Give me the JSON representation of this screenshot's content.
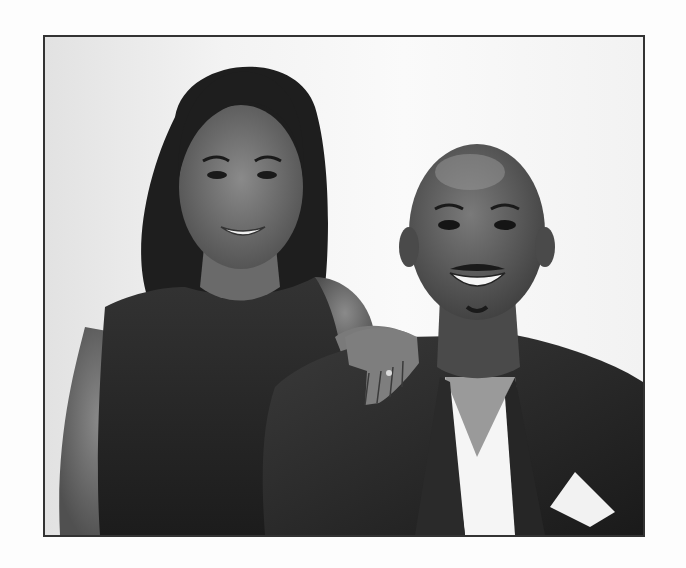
{
  "image": {
    "alt": "Black and white portrait of a smiling woman with long straight hair in a sleeveless dark dress, resting her hand on the shoulder of a smiling bald man in a dark blazer with white shirt and pocket square",
    "style": "grayscale photograph with thin dark border",
    "colors": {
      "background": "#fdfdfd",
      "border": "#333333",
      "backdrop": "#f0f0f0",
      "dark_clothing": "#2a2a2a",
      "skin": "#6e6e6e",
      "hair": "#1e1e1e",
      "white_shirt": "#f5f5f5"
    },
    "subjects": [
      {
        "label": "woman",
        "position": "left",
        "description": "long dark straight hair, sleeveless dark dress, hand on man's shoulder"
      },
      {
        "label": "man",
        "position": "right",
        "description": "bald, smiling with mustache, dark blazer, white V-neck shirt, white pocket square"
      }
    ]
  }
}
